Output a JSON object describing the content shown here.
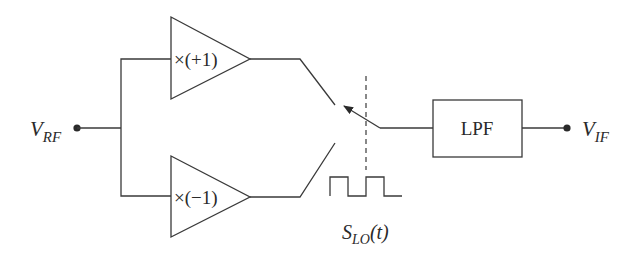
{
  "diagram": {
    "type": "circuit-block-diagram",
    "input": {
      "symbol": "V",
      "subscript": "RF"
    },
    "output": {
      "symbol": "V",
      "subscript": "IF"
    },
    "amplifiers": [
      {
        "id": "top",
        "label": "×(+1)"
      },
      {
        "id": "bottom",
        "label": "×(−1)"
      }
    ],
    "switch": {
      "control_signal": {
        "symbol": "S",
        "subscript": "LO",
        "arg": "(t)"
      }
    },
    "filter": {
      "label": "LPF"
    },
    "colors": {
      "line": "#3a3a3a",
      "text": "#2a2a2a",
      "background": "#ffffff"
    }
  }
}
